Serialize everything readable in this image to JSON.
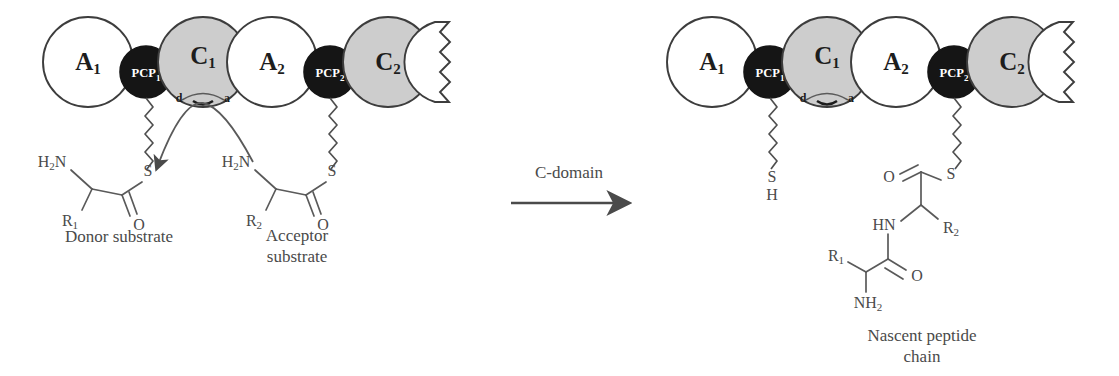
{
  "figure": {
    "domain_type": "diagram"
  },
  "colors": {
    "a_domain_fill": "#ffffff",
    "c_domain_fill": "#cdcdcd",
    "pcp_domain_fill": "#151515",
    "outline": "#3d3d3d",
    "text": "#4a4a4a",
    "background": "#ffffff"
  },
  "left_panel": {
    "modules": [
      {
        "label": "A",
        "subscript": "1",
        "type": "adenylation",
        "fill": "white"
      },
      {
        "label": "PCP",
        "subscript": "1",
        "type": "carrier",
        "fill": "black"
      },
      {
        "label": "C",
        "subscript": "1",
        "type": "condensation",
        "fill": "gray"
      },
      {
        "label": "A",
        "subscript": "2",
        "type": "adenylation",
        "fill": "white"
      },
      {
        "label": "PCP",
        "subscript": "2",
        "type": "carrier",
        "fill": "black"
      },
      {
        "label": "C",
        "subscript": "2",
        "type": "condensation",
        "fill": "gray"
      }
    ],
    "site_labels": {
      "donor": "d",
      "acceptor": "a"
    },
    "donor_substrate": {
      "caption": "Donor substrate",
      "atoms": {
        "amine": "H",
        "amine_sub": "2",
        "amine_tail": "N",
        "side_chain": "R",
        "side_chain_sub": "1",
        "sulfur": "S",
        "oxygen": "O"
      }
    },
    "acceptor_substrate": {
      "caption_line1": "Acceptor",
      "caption_line2": "substrate",
      "atoms": {
        "amine": "H",
        "amine_sub": "2",
        "amine_tail": "N",
        "side_chain": "R",
        "side_chain_sub": "2",
        "sulfur": "S",
        "oxygen": "O"
      }
    },
    "nucleophilic_attack_arrow": "curved-arrow-from-acceptor-amine-to-donor-carbonyl"
  },
  "reaction_arrow": {
    "label": "C-domain",
    "direction": "right"
  },
  "right_panel": {
    "modules": [
      {
        "label": "A",
        "subscript": "1",
        "type": "adenylation",
        "fill": "white"
      },
      {
        "label": "PCP",
        "subscript": "1",
        "type": "carrier",
        "fill": "black"
      },
      {
        "label": "C",
        "subscript": "1",
        "type": "condensation",
        "fill": "gray"
      },
      {
        "label": "A",
        "subscript": "2",
        "type": "adenylation",
        "fill": "white"
      },
      {
        "label": "PCP",
        "subscript": "2",
        "type": "carrier",
        "fill": "black"
      },
      {
        "label": "C",
        "subscript": "2",
        "type": "condensation",
        "fill": "gray"
      }
    ],
    "site_labels": {
      "donor": "d",
      "acceptor": "a"
    },
    "free_thiol": {
      "sulfur": "S",
      "hydrogen": "H"
    },
    "nascent_peptide": {
      "caption_line1": "Nascent peptide",
      "caption_line2": "chain",
      "atoms": {
        "sulfur": "S",
        "thioester_oxygen": "O",
        "amide_nitrogen": "HN",
        "residue2": "R",
        "residue2_sub": "2",
        "amide_oxygen": "O",
        "residue1": "R",
        "residue1_sub": "1",
        "terminal_amine": "NH",
        "terminal_amine_sub": "2"
      }
    }
  }
}
